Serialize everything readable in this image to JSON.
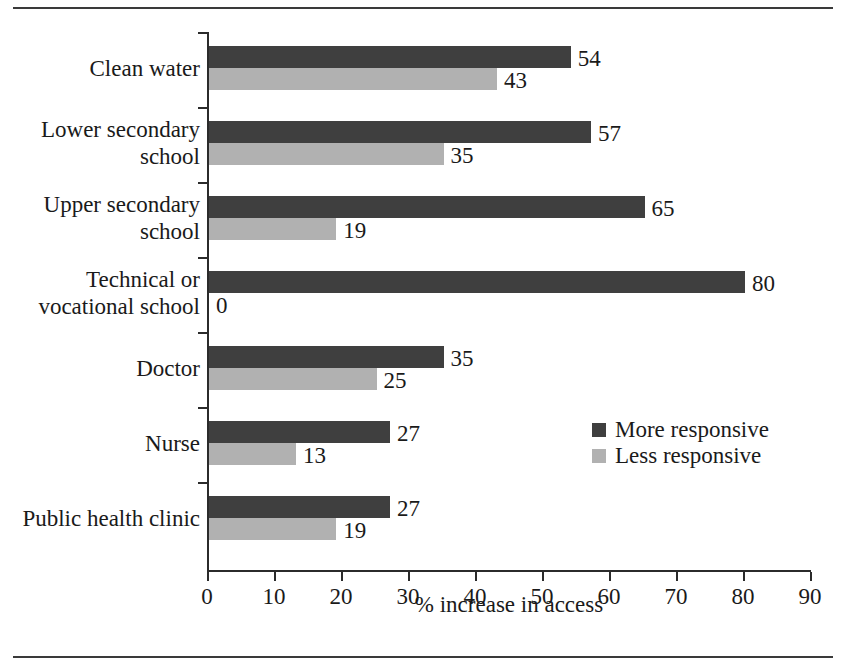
{
  "chart_data": {
    "type": "bar",
    "orientation": "horizontal",
    "title": "",
    "xlabel": "% increase in access",
    "ylabel": "",
    "xlim": [
      0,
      90
    ],
    "xticks": [
      0,
      10,
      20,
      30,
      40,
      50,
      60,
      70,
      80,
      90
    ],
    "xtick_labels": [
      "0",
      "10",
      "20",
      "30",
      "40",
      "50",
      "60",
      "70",
      "80",
      "90"
    ],
    "grid": false,
    "legend_position": "middle-right",
    "categories": [
      "Clean water",
      "Lower secondary\nschool",
      "Upper secondary\nschool",
      "Technical or\nvocational school",
      "Doctor",
      "Nurse",
      "Public health clinic"
    ],
    "series": [
      {
        "name": "More responsive",
        "color": "#3f3f3f",
        "values": [
          54,
          57,
          65,
          80,
          35,
          27,
          27
        ],
        "value_labels": [
          "54",
          "57",
          "65",
          "80",
          "35",
          "27",
          "27"
        ]
      },
      {
        "name": "Less responsive",
        "color": "#b1b1b1",
        "values": [
          43,
          35,
          19,
          0,
          25,
          13,
          19
        ],
        "value_labels": [
          "43",
          "35",
          "19",
          "0",
          "25",
          "13",
          "19"
        ]
      }
    ]
  },
  "legend": {
    "items": [
      {
        "label": "More responsive",
        "color": "#3f3f3f"
      },
      {
        "label": "Less responsive",
        "color": "#b1b1b1"
      }
    ]
  },
  "axis": {
    "x_title": "% increase in access",
    "tick_labels": [
      "0",
      "10",
      "20",
      "30",
      "40",
      "50",
      "60",
      "70",
      "80",
      "90"
    ]
  },
  "colors": {
    "more_responsive": "#3f3f3f",
    "less_responsive": "#b1b1b1",
    "axis": "#2b2b2b",
    "rule": "#3a3a3a",
    "text": "#1a1a1a",
    "background": "#ffffff"
  }
}
